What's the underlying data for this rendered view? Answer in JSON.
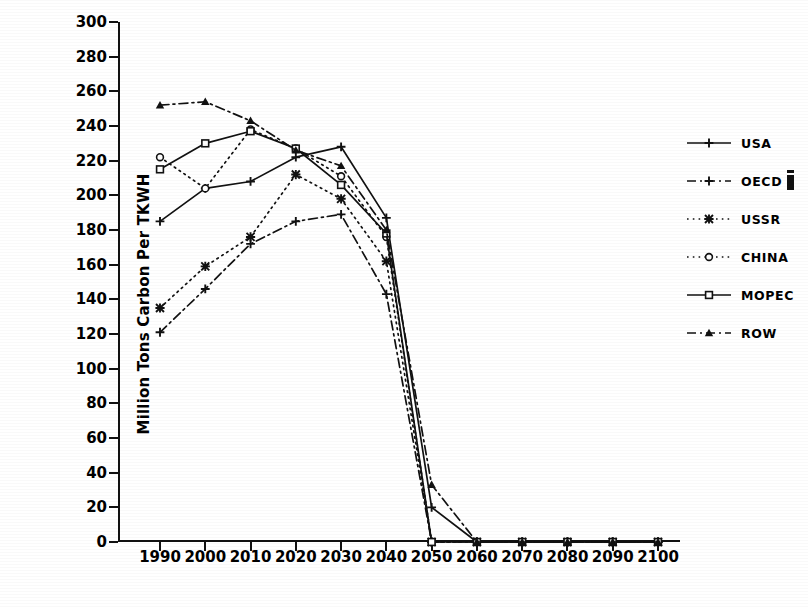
{
  "chart_data": {
    "type": "line",
    "title": "",
    "xlabel": "",
    "ylabel": "Million Tons Carbon Per TKWH",
    "xlim": [
      1990,
      2100
    ],
    "ylim": [
      0,
      300
    ],
    "ytick_step": 20,
    "grid": false,
    "legend_position": "right",
    "categories": [
      1990,
      2000,
      2010,
      2020,
      2030,
      2040,
      2050,
      2060,
      2070,
      2080,
      2090,
      2100
    ],
    "series": [
      {
        "name": "USA",
        "marker": "plus",
        "line_style": "solid",
        "values": [
          185,
          204,
          208,
          222,
          228,
          187,
          20,
          0,
          0,
          0,
          0,
          0
        ]
      },
      {
        "name": "OECD",
        "marker": "plus",
        "line_style": "dash-dot",
        "values": [
          121,
          146,
          172,
          185,
          189,
          143,
          0,
          0,
          0,
          0,
          0,
          0
        ]
      },
      {
        "name": "USSR",
        "marker": "star",
        "line_style": "dotted",
        "values": [
          135,
          159,
          176,
          212,
          198,
          162,
          0,
          0,
          0,
          0,
          0,
          0
        ]
      },
      {
        "name": "CHINA",
        "marker": "circle",
        "line_style": "dotted",
        "values": [
          222,
          204,
          238,
          227,
          211,
          176,
          0,
          0,
          0,
          0,
          0,
          0
        ]
      },
      {
        "name": "MOPEC",
        "marker": "square",
        "line_style": "solid",
        "values": [
          215,
          230,
          237,
          227,
          206,
          178,
          0,
          0,
          0,
          0,
          0,
          0
        ]
      },
      {
        "name": "ROW",
        "marker": "triangle",
        "line_style": "dash-dot",
        "values": [
          252,
          254,
          243,
          226,
          217,
          180,
          33,
          0,
          0,
          0,
          0,
          0
        ]
      }
    ]
  },
  "axes": {
    "y_tick_labels": [
      "300",
      "280",
      "260",
      "240",
      "220",
      "200",
      "180",
      "160",
      "140",
      "120",
      "100",
      "80",
      "60",
      "40",
      "20",
      "0"
    ],
    "y_title": "Million Tons Carbon Per TKWH",
    "x_tick_labels": [
      "1990",
      "2000",
      "2010",
      "2020",
      "2030",
      "2040",
      "2050",
      "2060",
      "2070",
      "2080",
      "2090",
      "2100"
    ]
  },
  "legend": {
    "items": [
      {
        "label": "USA",
        "marker": "plus",
        "line_style": "solid",
        "artifact": false
      },
      {
        "label": "OECD",
        "marker": "plus",
        "line_style": "dash-dot",
        "artifact": true
      },
      {
        "label": "USSR",
        "marker": "star",
        "line_style": "dotted",
        "artifact": false
      },
      {
        "label": "CHINA",
        "marker": "circle",
        "line_style": "dotted",
        "artifact": false
      },
      {
        "label": "MOPEC",
        "marker": "square",
        "line_style": "solid",
        "artifact": false
      },
      {
        "label": "ROW",
        "marker": "triangle",
        "line_style": "dash-dot",
        "artifact": false
      }
    ]
  },
  "colors": {
    "ink": "#111111",
    "paper": "#ffffff"
  }
}
